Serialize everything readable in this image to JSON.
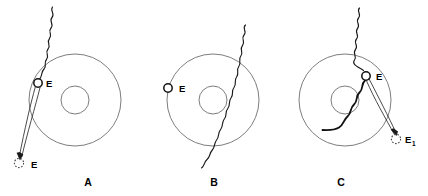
{
  "figure": {
    "background_color": "#ffffff",
    "width": 428,
    "height": 196,
    "colors": {
      "ring_stroke": "#6e6e6e",
      "wave_stroke": "#1a1a1a",
      "electron_stroke": "#111111",
      "label_color": "#000000"
    }
  },
  "panels": [
    {
      "id": "panel-a",
      "caption": "A",
      "caption_x": 88,
      "caption_y": 186,
      "shell": {
        "cx": 75,
        "cy": 100,
        "r_outer": 46,
        "r_inner": 14
      },
      "labels": [
        {
          "name": "electron-bound",
          "text": "E",
          "x": 46,
          "y": 87
        },
        {
          "name": "electron-ejected",
          "text": "E",
          "x": 31,
          "y": 168
        }
      ],
      "electron_bound": {
        "cx": 38,
        "cy": 83,
        "r": 4.2
      },
      "electron_ghost": {
        "cx": 19,
        "cy": 163,
        "r": 4.6
      }
    },
    {
      "id": "panel-b",
      "caption": "B",
      "caption_x": 214,
      "caption_y": 186,
      "shell": {
        "cx": 213,
        "cy": 100,
        "r_outer": 46,
        "r_inner": 14
      },
      "labels": [
        {
          "name": "electron-bound",
          "text": "E",
          "x": 179,
          "y": 92
        }
      ],
      "electron_bound": {
        "cx": 168,
        "cy": 88,
        "r": 4.2
      },
      "electron_ghost": null
    },
    {
      "id": "panel-c",
      "caption": "C",
      "caption_x": 341,
      "caption_y": 186,
      "shell": {
        "cx": 345,
        "cy": 100,
        "r_outer": 46,
        "r_inner": 14
      },
      "labels": [
        {
          "name": "electron-bound",
          "text": "E",
          "x": 376,
          "y": 80
        },
        {
          "name": "electron-scattered",
          "text": "E",
          "subscript": "1",
          "x": 405,
          "y": 143
        }
      ],
      "electron_bound": {
        "cx": 366,
        "cy": 76,
        "r": 4.2
      },
      "electron_ghost": {
        "cx": 396,
        "cy": 139,
        "r": 4.6
      }
    }
  ],
  "captions": {
    "a": "A",
    "b": "B",
    "c": "C"
  },
  "symbols": {
    "electron_label": "E",
    "scattered_electron_label": "E",
    "scattered_electron_subscript": "1"
  }
}
